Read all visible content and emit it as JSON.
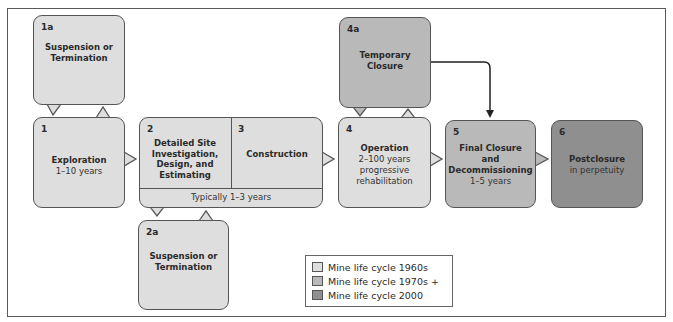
{
  "diagram": {
    "type": "flowchart",
    "title": "Mine life cycle"
  },
  "colors": {
    "mine_life_cycle_1960s": "#dedede",
    "mine_life_cycle_1970s_plus": "#b9b9b9",
    "mine_life_cycle_2000": "#8f8f8f"
  },
  "stages": {
    "s1a": {
      "number": "1a",
      "title": "Suspension or Termination",
      "line1": "Suspension or",
      "line2": "Termination",
      "era": "1960s"
    },
    "s1": {
      "number": "1",
      "title": "Exploration",
      "duration": "1–10 years",
      "era": "1960s"
    },
    "s2": {
      "number": "2",
      "line1": "Detailed Site",
      "line2": "Investigation,",
      "line3": "Design, and",
      "line4": "Estimating",
      "era": "1960s"
    },
    "s3": {
      "number": "3",
      "title": "Construction",
      "era": "1960s"
    },
    "s23_duration": "Typically 1–3 years",
    "s2a": {
      "number": "2a",
      "line1": "Suspension or",
      "line2": "Termination",
      "era": "1960s"
    },
    "s4a": {
      "number": "4a",
      "line1": "Temporary",
      "line2": "Closure",
      "era": "1970s +"
    },
    "s4": {
      "number": "4",
      "title": "Operation",
      "duration": "2–100 years",
      "note1": "progressive",
      "note2": "rehabilitation",
      "era": "1960s"
    },
    "s5": {
      "number": "5",
      "line1": "Final Closure",
      "line2": "and",
      "line3": "Decommissioning",
      "duration": "1–5 years",
      "era": "1970s +"
    },
    "s6": {
      "number": "6",
      "title": "Postclosure",
      "duration": "in perpetuity",
      "era": "2000"
    }
  },
  "connections": [
    {
      "from": "1",
      "to": "1a",
      "type": "callout-pair"
    },
    {
      "from": "1",
      "to": "2",
      "type": "pointer"
    },
    {
      "from": "2-3",
      "to": "2a",
      "type": "callout-pair"
    },
    {
      "from": "3",
      "to": "4",
      "type": "pointer"
    },
    {
      "from": "4",
      "to": "4a",
      "type": "callout-pair"
    },
    {
      "from": "4a",
      "to": "5",
      "type": "arrow"
    },
    {
      "from": "4",
      "to": "5",
      "type": "pointer"
    },
    {
      "from": "5",
      "to": "6",
      "type": "pointer"
    }
  ],
  "legend": {
    "items": [
      {
        "label": "Mine life cycle 1960s",
        "color": "#dedede"
      },
      {
        "label": "Mine life cycle 1970s +",
        "color": "#b9b9b9"
      },
      {
        "label": "Mine life cycle 2000",
        "color": "#8f8f8f"
      }
    ]
  }
}
